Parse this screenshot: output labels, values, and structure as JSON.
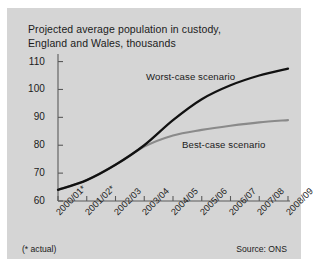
{
  "figure": {
    "title_line1": "Projected average population in custody,",
    "title_line2": "England and Wales, thousands",
    "footnote": "(* actual)",
    "source": "Source: ONS",
    "panel_color": "#d5d5d5",
    "worst_color": "#111111",
    "best_color": "#8a8a8a"
  },
  "chart_data": {
    "type": "line",
    "title": "Projected average population in custody, England and Wales, thousands",
    "xlabel": "",
    "ylabel": "thousands",
    "categories": [
      "2000/01*",
      "2001/02*",
      "2002/03",
      "2003/04",
      "2004/05",
      "2005/06",
      "2006/07",
      "2007/08",
      "2008/09"
    ],
    "yticks": [
      60,
      70,
      80,
      90,
      100,
      110
    ],
    "ylim": [
      60,
      112
    ],
    "grid": false,
    "legend": "inline-annotations",
    "annotations": [
      "Worst-case scenario",
      "Best-case scenario",
      "(* actual)",
      "Source: ONS"
    ],
    "series": [
      {
        "name": "Worst-case scenario",
        "color": "#111111",
        "values": [
          64.0,
          67.5,
          73.0,
          80.0,
          89.0,
          96.5,
          101.5,
          105.0,
          107.5
        ]
      },
      {
        "name": "Best-case scenario",
        "color": "#8a8a8a",
        "values": [
          64.0,
          67.5,
          73.0,
          79.5,
          83.5,
          85.5,
          87.0,
          88.2,
          89.0
        ]
      }
    ]
  }
}
